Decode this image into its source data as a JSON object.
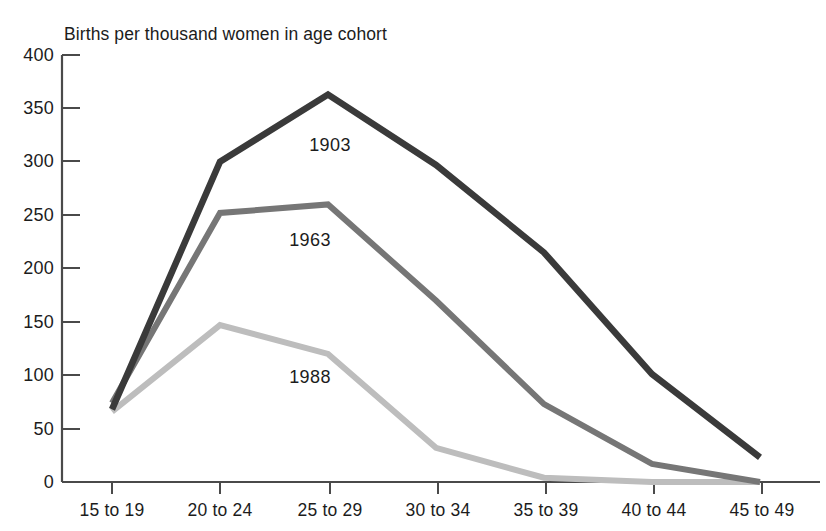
{
  "chart_data": {
    "type": "line",
    "title": "Births per thousand women in age cohort",
    "xlabel": "",
    "ylabel": "",
    "ylim": [
      0,
      400
    ],
    "ytick_step": 50,
    "yticks": [
      0,
      50,
      100,
      150,
      200,
      250,
      300,
      350,
      400
    ],
    "grid": false,
    "legend": "inline-annotations",
    "categories": [
      "15 to 19",
      "20 to 24",
      "25 to 29",
      "30 to 34",
      "35 to 39",
      "40 to 44",
      "45 to 49"
    ],
    "series": [
      {
        "name": "1903",
        "color": "#3a3a3a",
        "values": [
          68,
          300,
          363,
          297,
          215,
          101,
          23
        ],
        "label_point": {
          "category": "25 to 29",
          "text": "1903"
        }
      },
      {
        "name": "1963",
        "color": "#767676",
        "values": [
          74,
          252,
          260,
          170,
          73,
          17,
          0
        ],
        "label_point": {
          "category": "25 to 29",
          "text": "1963"
        }
      },
      {
        "name": "1988",
        "color": "#bdbdbd",
        "values": [
          66,
          147,
          120,
          32,
          4,
          0,
          0
        ],
        "label_point": {
          "category": "25 to 29",
          "text": "1988"
        }
      }
    ],
    "annotations": [
      {
        "text": "1903",
        "x_px": 330,
        "y_px": 145
      },
      {
        "text": "1963",
        "x_px": 310,
        "y_px": 240
      },
      {
        "text": "1988",
        "x_px": 310,
        "y_px": 377
      }
    ],
    "axis_color": "#4a4a4a"
  },
  "yticks": {
    "t400": "400",
    "t350": "350",
    "t300": "300",
    "t250": "250",
    "t200": "200",
    "t150": "150",
    "t100": "100",
    "t50": "50",
    "t0": "0"
  },
  "xticks": {
    "c0": "15 to 19",
    "c1": "20 to 24",
    "c2": "25 to 29",
    "c3": "30 to 34",
    "c4": "35 to 39",
    "c5": "40 to 44",
    "c6": "45 to 49"
  },
  "labels": {
    "s0": "1903",
    "s1": "1963",
    "s2": "1988"
  }
}
